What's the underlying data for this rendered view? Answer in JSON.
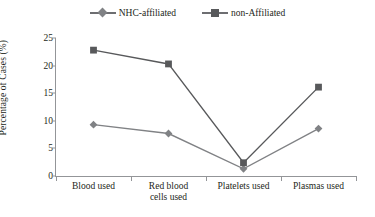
{
  "chart_data": {
    "type": "line",
    "title": "",
    "xlabel": "",
    "ylabel": "Percentage of Cases (%)",
    "categories": [
      "Blood used",
      "Red blood cells used",
      "Platelets used",
      "Plasmas used"
    ],
    "category_lines": [
      [
        "Blood used"
      ],
      [
        "Red blood",
        "cells used"
      ],
      [
        "Platelets used"
      ],
      [
        "Plasmas used"
      ]
    ],
    "ylim": [
      0,
      25
    ],
    "yticks": [
      0,
      5,
      10,
      15,
      20,
      25
    ],
    "grid": false,
    "legend_position": "top-center",
    "series": [
      {
        "name": "NHC-affiliated",
        "marker": "diamond",
        "color": "#808285",
        "values": [
          9.3,
          7.7,
          1.3,
          8.6
        ]
      },
      {
        "name": "non-Affiliated",
        "marker": "square",
        "color": "#58595b",
        "values": [
          22.8,
          20.3,
          2.4,
          16.1
        ]
      }
    ]
  },
  "legend": {
    "entries": [
      {
        "label": "NHC-affiliated",
        "marker": "diamond-marker-icon"
      },
      {
        "label": "non-Affiliated",
        "marker": "square-marker-icon"
      }
    ]
  },
  "axes": {
    "y_title": "Percentage of Cases (%)",
    "y_tick_labels": [
      "0",
      "5",
      "10",
      "15",
      "20",
      "25"
    ],
    "x_tick_labels": [
      "Blood used",
      "Red blood cells used",
      "Platelets used",
      "Plasmas used"
    ]
  },
  "colors": {
    "series_nhc": "#808285",
    "series_non_affiliated": "#58595b",
    "axis": "#939598",
    "text": "#231f20",
    "background": "#ffffff"
  }
}
